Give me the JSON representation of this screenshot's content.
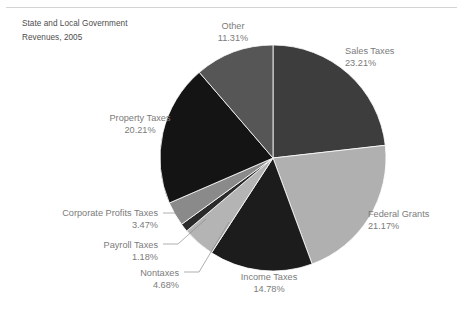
{
  "figure": {
    "title": "State and Local Government\nRevenues, 2005",
    "width": 463,
    "height": 310,
    "background": "#ffffff",
    "rule_color": "#d2d4d6",
    "label_color": "#7b7b7b",
    "title_color": "#4d4d4d",
    "leader_color": "#8d8d8d"
  },
  "pie": {
    "center_x": 273,
    "center_y": 158,
    "radius": 113,
    "start_angle_deg": 0,
    "direction": "clockwise",
    "edge_color": "#ffffff"
  },
  "chart_data": {
    "type": "pie",
    "title": "State and Local Government Revenues, 2005",
    "xlabel": "",
    "ylabel": "",
    "legend_position": "none",
    "grid": false,
    "units": "percent",
    "categories": [
      "Sales Taxes",
      "Federal Grants",
      "Income Taxes",
      "Nontaxes",
      "Payroll Taxes",
      "Corporate Profits Taxes",
      "Property Taxes",
      "Other"
    ],
    "values": [
      23.21,
      21.17,
      14.78,
      4.68,
      1.18,
      3.47,
      20.21,
      11.31
    ],
    "colors": [
      "#3d3d3d",
      "#b0b0b0",
      "#1c1c1c",
      "#b4b4b4",
      "#2a2a2a",
      "#8a8a8a",
      "#141414",
      "#565656"
    ],
    "slices": [
      {
        "name": "Sales Taxes",
        "value": 23.21,
        "label": "Sales Taxes\n23.21%",
        "percent_text": "23.21%",
        "color": "#3d3d3d",
        "label_x": 345,
        "label_y": 46,
        "label_w": 110,
        "label_align": "left",
        "leader": false
      },
      {
        "name": "Federal Grants",
        "value": 21.17,
        "label": "Federal Grants\n21.17%",
        "percent_text": "21.17%",
        "color": "#b0b0b0",
        "label_x": 368,
        "label_y": 209,
        "label_w": 92,
        "label_align": "left",
        "leader": false
      },
      {
        "name": "Income Taxes",
        "value": 14.78,
        "label": "Income Taxes\n14.78%",
        "percent_text": "14.78%",
        "color": "#1c1c1c",
        "label_x": 228,
        "label_y": 272,
        "label_w": 82,
        "label_align": "center",
        "leader": false
      },
      {
        "name": "Nontaxes",
        "value": 4.68,
        "label": "Nontaxes\n4.68%",
        "percent_text": "4.68%",
        "color": "#b4b4b4",
        "label_x": 113,
        "label_y": 268,
        "label_w": 66,
        "label_align": "right",
        "leader": true,
        "leader_from_x": 184,
        "leader_from_y": 272,
        "leader_mid_x": 199,
        "leader_mid_y": 272,
        "leader_to_x": 229,
        "leader_to_y": 222
      },
      {
        "name": "Payroll Taxes",
        "value": 1.18,
        "label": "Payroll Taxes\n1.18%",
        "percent_text": "1.18%",
        "color": "#2a2a2a",
        "label_x": 86,
        "label_y": 240,
        "label_w": 72,
        "label_align": "right",
        "leader": true,
        "leader_from_x": 163,
        "leader_from_y": 244,
        "leader_mid_x": 178,
        "leader_mid_y": 244,
        "leader_to_x": 206,
        "leader_to_y": 219
      },
      {
        "name": "Corporate Profits Taxes",
        "value": 3.47,
        "label": "Corporate Profits Taxes\n3.47%",
        "percent_text": "3.47%",
        "color": "#8a8a8a",
        "label_x": 41,
        "label_y": 208,
        "label_w": 117,
        "label_align": "right",
        "leader": true,
        "leader_from_x": 163,
        "leader_from_y": 213,
        "leader_mid_x": 178,
        "leader_mid_y": 213,
        "leader_to_x": 199,
        "leader_to_y": 203
      },
      {
        "name": "Property  Taxes",
        "value": 20.21,
        "label": "Property  Taxes\n20.21%",
        "percent_text": "20.21%",
        "color": "#141414",
        "label_x": 92,
        "label_y": 113,
        "label_w": 96,
        "label_align": "center",
        "leader": false
      },
      {
        "name": "Other",
        "value": 11.31,
        "label": "Other\n11.31%",
        "percent_text": "11.31%",
        "color": "#565656",
        "label_x": 200,
        "label_y": 21,
        "label_w": 66,
        "label_align": "center",
        "leader": false
      }
    ]
  }
}
